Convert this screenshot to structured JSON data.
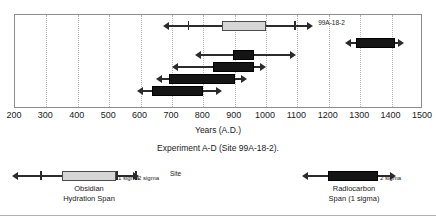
{
  "figure": {
    "caption": "Experiment A-D (Site 99A-18-2).",
    "axis_title": "Years (A.D.)"
  },
  "chart_data": {
    "type": "bar",
    "title": "Experiment A-D (Site 99A-18-2).",
    "xlabel": "Years (A.D.)",
    "ylabel": "",
    "xlim": [
      200,
      1500
    ],
    "xticks": [
      200,
      300,
      400,
      500,
      600,
      700,
      800,
      900,
      1000,
      1100,
      1200,
      1300,
      1400,
      1500
    ],
    "grid": true,
    "orientation": "horizontal-ranges",
    "legend_position": "below",
    "series": [
      {
        "name": "Obsidian Hydration Span",
        "kind": "obsidian",
        "color": "#d6d6d6"
      },
      {
        "name": "Radiocarbon Span (1 sigma)",
        "kind": "radiocarbon",
        "color": "#151515"
      }
    ],
    "rows": [
      {
        "label": "99A-18-2",
        "kind": "obsidian",
        "span_start": 860,
        "span_end": 1000,
        "sigma1_start": 750,
        "sigma1_end": 1090,
        "sigma2_start": 670,
        "sigma2_end": 1150
      },
      {
        "label": "",
        "kind": "radiocarbon",
        "span_start": 1285,
        "span_end": 1410,
        "sigma2_start": 1250,
        "sigma2_end": 1440
      },
      {
        "label": "",
        "kind": "radiocarbon",
        "span_start": 895,
        "span_end": 960,
        "sigma2_start": 775,
        "sigma2_end": 1095
      },
      {
        "label": "",
        "kind": "radiocarbon",
        "span_start": 830,
        "span_end": 960,
        "sigma2_start": 700,
        "sigma2_end": 1000
      },
      {
        "label": "",
        "kind": "radiocarbon",
        "span_start": 690,
        "span_end": 900,
        "sigma2_start": 650,
        "sigma2_end": 940
      },
      {
        "label": "",
        "kind": "radiocarbon",
        "span_start": 635,
        "span_end": 800,
        "sigma2_start": 590,
        "sigma2_end": 860
      }
    ]
  },
  "legend_obsidian": {
    "caption_line1": "Obsidian",
    "caption_line2": "Hydration Span",
    "sigma1": "1 sigma",
    "sigma2": "2 sigma",
    "site": "Site"
  },
  "legend_radiocarbon": {
    "caption_line1": "Radiocarbon",
    "caption_line2": "Span (1 sigma)",
    "sigma2": "2 sigma"
  }
}
